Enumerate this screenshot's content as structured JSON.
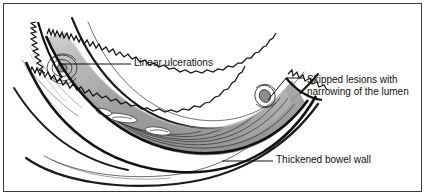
{
  "figure": {
    "type": "medical-illustration",
    "background_color": "#ffffff",
    "border_color": "#3a3a3a",
    "ink_color": "#111111"
  },
  "annotations": {
    "linear_ulcerations": {
      "text": "Linear ulcerations",
      "leader": "horizontal-line-to-left"
    },
    "skipped_lesions": {
      "line1": "Skipped lesions with",
      "line2": "narrowing of the lumen",
      "leader": "angled-line-to-lower-left"
    },
    "thickened_bowel_wall": {
      "text": "Thickened bowel wall",
      "leader": "horizontal-line-to-left"
    }
  },
  "palette": {
    "wall_outline": "#111111",
    "lumen_shadow_dark": "#8c8c8c",
    "lumen_shadow_mid": "#a8a8a8",
    "lumen_shadow_light": "#cfcfcf",
    "ulceration_fill": "#ffffff",
    "serosa_line": "#1a1a1a"
  }
}
